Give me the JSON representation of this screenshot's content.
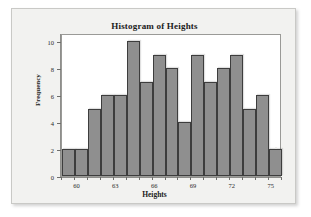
{
  "figure": {
    "background_color": "#f2f2f0",
    "plot_background_color": "#ffffff",
    "bar_fill_color": "#8f8f8f",
    "bar_edge_color": "#3d3d3d"
  },
  "chart_data": {
    "type": "bar",
    "title": "Histogram of Heights",
    "xlabel": "Heights",
    "ylabel": "Frequency",
    "bin_width": 1,
    "bin_start": 58.8,
    "categories": [
      "58.8-59.8",
      "59.8-60.8",
      "60.8-61.8",
      "61.8-62.8",
      "62.8-63.8",
      "63.8-64.8",
      "64.8-65.8",
      "65.8-66.8",
      "66.8-67.8",
      "67.8-68.8",
      "68.8-69.8",
      "69.8-70.8",
      "70.8-71.8",
      "71.8-72.8",
      "72.8-73.8",
      "73.8-74.8",
      "74.8-75.8"
    ],
    "values": [
      2,
      2,
      5,
      6,
      6,
      10,
      7,
      9,
      8,
      4,
      9,
      7,
      8,
      9,
      5,
      6,
      2
    ],
    "x": [
      59.3,
      60.3,
      61.3,
      62.3,
      63.3,
      64.3,
      65.3,
      66.3,
      67.3,
      68.3,
      69.3,
      70.3,
      71.3,
      72.3,
      73.3,
      74.3,
      75.3
    ],
    "xlim": [
      58.8,
      75.8
    ],
    "ylim": [
      0,
      10.6
    ],
    "xticks": [
      60,
      63,
      66,
      69,
      72,
      75
    ],
    "xtick_labels": [
      "60",
      "63",
      "66",
      "69",
      "72",
      "75"
    ],
    "yticks": [
      0,
      2,
      4,
      6,
      8,
      10
    ],
    "ytick_labels": [
      "0",
      "2",
      "4",
      "6",
      "8",
      "10"
    ],
    "grid": false,
    "legend": null
  }
}
